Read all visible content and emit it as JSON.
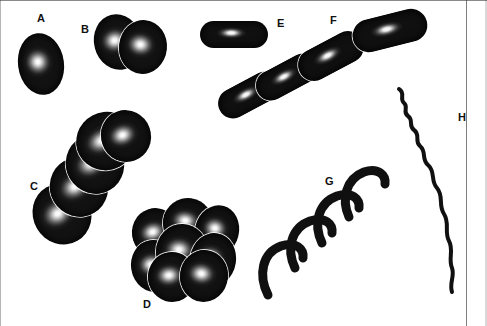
{
  "figure": {
    "background_color": "#ffffff",
    "ink_color": "#111111",
    "width": 487,
    "height": 326
  },
  "labels": [
    {
      "id": "A",
      "text": "A",
      "x": 37,
      "y": 13,
      "describes": "single-coccus"
    },
    {
      "id": "B",
      "text": "B",
      "x": 81,
      "y": 24,
      "describes": "diplococci"
    },
    {
      "id": "C",
      "text": "C",
      "x": 30,
      "y": 181,
      "describes": "streptococci-chain"
    },
    {
      "id": "D",
      "text": "D",
      "x": 143,
      "y": 299,
      "describes": "staphylococci-cluster"
    },
    {
      "id": "E",
      "text": "E",
      "x": 277,
      "y": 18,
      "describes": "single-bacillus"
    },
    {
      "id": "F",
      "text": "F",
      "x": 330,
      "y": 15,
      "describes": "streptobacilli-chain"
    },
    {
      "id": "G",
      "text": "G",
      "x": 325,
      "y": 176,
      "describes": "spirilla"
    },
    {
      "id": "H",
      "text": "H",
      "x": 458,
      "y": 112,
      "describes": "spirochete"
    }
  ],
  "specimens": {
    "A": {
      "name": "single-coccus",
      "kind": "coccus",
      "cells": [
        {
          "x": 18,
          "y": 33,
          "w": 46,
          "h": 62,
          "rot": -8
        }
      ]
    },
    "B": {
      "name": "diplococci",
      "kind": "coccus",
      "cells": [
        {
          "x": 94,
          "y": 14,
          "w": 48,
          "h": 56,
          "rot": -14
        },
        {
          "x": 119,
          "y": 20,
          "w": 48,
          "h": 54,
          "rot": 6
        }
      ]
    },
    "C": {
      "name": "streptococci-chain",
      "kind": "coccus",
      "cells": [
        {
          "x": 33,
          "y": 183,
          "w": 58,
          "h": 62,
          "rot": -30
        },
        {
          "x": 50,
          "y": 157,
          "w": 58,
          "h": 60,
          "rot": -30
        },
        {
          "x": 66,
          "y": 134,
          "w": 58,
          "h": 60,
          "rot": -30
        },
        {
          "x": 76,
          "y": 112,
          "w": 60,
          "h": 58,
          "rot": -28
        },
        {
          "x": 101,
          "y": 110,
          "w": 50,
          "h": 52,
          "rot": -20
        }
      ]
    },
    "D": {
      "name": "staphylococci-cluster",
      "kind": "coccus",
      "cells": [
        {
          "x": 132,
          "y": 208,
          "w": 48,
          "h": 50,
          "rot": -18
        },
        {
          "x": 163,
          "y": 198,
          "w": 50,
          "h": 50,
          "rot": 8
        },
        {
          "x": 195,
          "y": 205,
          "w": 44,
          "h": 52,
          "rot": 14
        },
        {
          "x": 131,
          "y": 240,
          "w": 46,
          "h": 52,
          "rot": -10
        },
        {
          "x": 156,
          "y": 224,
          "w": 52,
          "h": 56,
          "rot": 2
        },
        {
          "x": 190,
          "y": 233,
          "w": 46,
          "h": 54,
          "rot": 10
        },
        {
          "x": 148,
          "y": 252,
          "w": 48,
          "h": 50,
          "rot": -6
        },
        {
          "x": 180,
          "y": 250,
          "w": 48,
          "h": 52,
          "rot": 6
        }
      ]
    },
    "E": {
      "name": "single-bacillus",
      "kind": "rod",
      "cells": [
        {
          "x": 200,
          "y": 21,
          "w": 68,
          "h": 27,
          "rot": 0
        }
      ]
    },
    "F": {
      "name": "streptobacilli-chain",
      "kind": "rod",
      "cells": [
        {
          "x": 216,
          "y": 80,
          "w": 66,
          "h": 30,
          "rot": -28
        },
        {
          "x": 254,
          "y": 62,
          "w": 66,
          "h": 30,
          "rot": -28
        },
        {
          "x": 296,
          "y": 40,
          "w": 70,
          "h": 32,
          "rot": -28
        },
        {
          "x": 352,
          "y": 14,
          "w": 76,
          "h": 33,
          "rot": -14
        }
      ]
    },
    "G": {
      "name": "spirilla",
      "kind": "spiral",
      "stroke_color": "#101010",
      "stroke_width": 9,
      "segments": [
        "M 268 295 C 258 275, 262 253, 281 246 C 296 241, 304 249, 303 258",
        "M 295 268 C 286 249, 291 228, 310 221 C 325 216, 333 224, 332 233",
        "M 322 243 C 313 224, 318 203, 337 196 C 352 191, 360 199, 359 208",
        "M 349 217 C 341 199, 346 179, 364 172 C 378 167, 386 175, 385 184"
      ]
    },
    "H": {
      "name": "spirochete",
      "kind": "spiral",
      "stroke_color": "#101010",
      "stroke_width": 4,
      "segments": [
        "M 399 89 C 406 93, 399 99, 404 103 C 409 107, 402 112, 408 116 C 414 120, 408 126, 414 130 C 421 135, 414 141, 420 146 C 427 152, 421 159, 428 165 C 436 172, 430 180, 437 188 C 444 196, 438 205, 444 214 C 450 223, 444 232, 449 241 C 454 250, 448 259, 452 268 C 455 276, 449 283, 452 292"
      ]
    }
  },
  "legend_note": ""
}
